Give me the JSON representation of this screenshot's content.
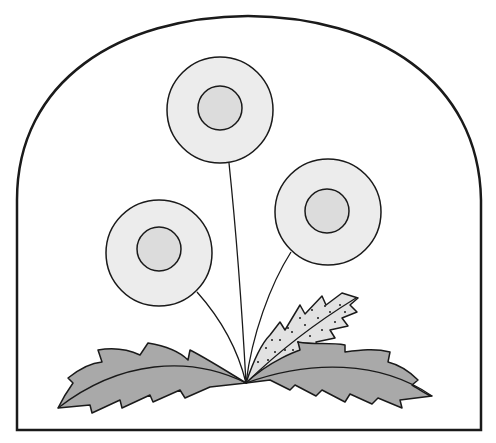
{
  "illustration": {
    "subject": "dandelion plant in arched frame",
    "colors": {
      "background": "#ffffff",
      "outline": "#1a1a1a",
      "petal_fill": "#ececec",
      "center_fill": "#dcdcdc",
      "leaf_fill": "#a9a9a9",
      "speckled_leaf_fill": "#e2e2e2"
    },
    "flowers": [
      {
        "name": "top",
        "cx": 220,
        "cy": 110,
        "r": 53,
        "inner_r": 22
      },
      {
        "name": "right",
        "cx": 328,
        "cy": 212,
        "r": 53,
        "inner_r": 22
      },
      {
        "name": "left",
        "cx": 159,
        "cy": 253,
        "r": 53,
        "inner_r": 22
      }
    ],
    "leaves": [
      "left-leaf",
      "right-leaf",
      "speckled-leaf"
    ]
  }
}
